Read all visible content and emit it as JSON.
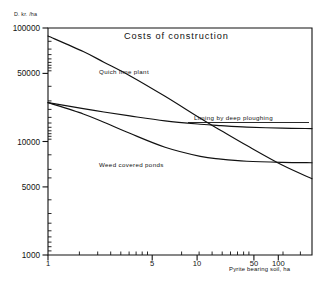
{
  "chart_data": {
    "type": "line",
    "title": "Costs of construction",
    "xlabel": "Pyrite bearing soil, ha",
    "ylabel": "D. kr. /ha",
    "xscale": "log",
    "yscale": "log",
    "xlim": [
      1,
      180
    ],
    "ylim": [
      1000,
      100000
    ],
    "grid": false,
    "legend": "inline-curve-labels",
    "xticks": [
      1,
      5,
      10,
      50,
      100
    ],
    "xtick_labels": [
      "1",
      "5",
      "10",
      "50",
      "100"
    ],
    "yticks": [
      1000,
      5000,
      10000,
      50000,
      100000
    ],
    "ytick_labels": [
      "1000",
      "5000",
      "10000",
      "50000",
      "100000"
    ],
    "series": [
      {
        "name": "Quich lime plant",
        "x": [
          1,
          2,
          3,
          5,
          10,
          20,
          30,
          50,
          100,
          180
        ],
        "values": [
          85000,
          62000,
          50000,
          38000,
          25000,
          16000,
          12500,
          9200,
          6200,
          4700
        ]
      },
      {
        "name": "Liming by deep ploughing",
        "x": [
          1,
          2,
          3,
          5,
          10,
          20,
          30,
          50,
          100,
          180
        ],
        "values": [
          22000,
          19500,
          18200,
          16800,
          15200,
          14200,
          13800,
          13400,
          13100,
          13000
        ]
      },
      {
        "name": "Weed covered ponds",
        "x": [
          1,
          2,
          3,
          5,
          10,
          20,
          30,
          50,
          100,
          180
        ],
        "values": [
          22000,
          17500,
          14800,
          11800,
          8900,
          7400,
          7000,
          6700,
          6550,
          6500
        ]
      }
    ]
  },
  "axis": {
    "y_unit_label": "D. kr. /ha",
    "x_title": "Pyrite bearing soil, ha"
  },
  "title": {
    "text": "Costs of construction"
  },
  "curve_labels": {
    "quich_lime_plant": "Quich lime plant",
    "liming_by_deep_ploughing": "Liming by deep ploughing",
    "weed_covered_ponds": "Weed covered ponds"
  },
  "colors": {
    "ink": "#111111",
    "background": "#ffffff"
  }
}
